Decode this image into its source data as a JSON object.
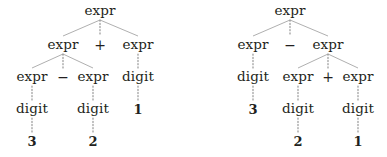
{
  "figure": {
    "background_color": "#ffffff",
    "text_color": "#231f20",
    "edge_color": "#8c8c8c",
    "width": 387,
    "height": 157
  },
  "trees": [
    {
      "id": "left-tree",
      "name": "left-parse-tree",
      "expression": "3 - 2 + 1",
      "grouping": "(3 - 2) + 1",
      "nodes": [
        {
          "id": "L0",
          "label": "expr",
          "kind": "nonterminal",
          "x": 100,
          "y": 11,
          "row": 0
        },
        {
          "id": "L1",
          "label": "expr",
          "kind": "nonterminal",
          "x": 63,
          "y": 45,
          "row": 1
        },
        {
          "id": "L2",
          "label": "+",
          "kind": "operator",
          "x": 100,
          "y": 45,
          "row": 1
        },
        {
          "id": "L3",
          "label": "expr",
          "kind": "nonterminal",
          "x": 138,
          "y": 45,
          "row": 1
        },
        {
          "id": "L4",
          "label": "expr",
          "kind": "nonterminal",
          "x": 32,
          "y": 77,
          "row": 2
        },
        {
          "id": "L5",
          "label": "−",
          "kind": "operator",
          "x": 63,
          "y": 77,
          "row": 2
        },
        {
          "id": "L6",
          "label": "expr",
          "kind": "nonterminal",
          "x": 93,
          "y": 77,
          "row": 2
        },
        {
          "id": "L7",
          "label": "digit",
          "kind": "nonterminal",
          "x": 138,
          "y": 77,
          "row": 2
        },
        {
          "id": "L8",
          "label": "digit",
          "kind": "nonterminal",
          "x": 32,
          "y": 109,
          "row": 3
        },
        {
          "id": "L9",
          "label": "digit",
          "kind": "nonterminal",
          "x": 93,
          "y": 109,
          "row": 3
        },
        {
          "id": "L10",
          "label": "1",
          "kind": "terminal",
          "x": 138,
          "y": 109,
          "row": 3
        },
        {
          "id": "L11",
          "label": "3",
          "kind": "terminal",
          "x": 32,
          "y": 141,
          "row": 4
        },
        {
          "id": "L12",
          "label": "2",
          "kind": "terminal",
          "x": 93,
          "y": 141,
          "row": 4
        }
      ],
      "edges": [
        {
          "from": "L0",
          "to": "L1",
          "style": "solid"
        },
        {
          "from": "L0",
          "to": "L2",
          "style": "dotted"
        },
        {
          "from": "L0",
          "to": "L3",
          "style": "solid"
        },
        {
          "from": "L1",
          "to": "L4",
          "style": "solid"
        },
        {
          "from": "L1",
          "to": "L5",
          "style": "dotted"
        },
        {
          "from": "L1",
          "to": "L6",
          "style": "solid"
        },
        {
          "from": "L3",
          "to": "L7",
          "style": "dotted"
        },
        {
          "from": "L4",
          "to": "L8",
          "style": "dotted"
        },
        {
          "from": "L6",
          "to": "L9",
          "style": "dotted"
        },
        {
          "from": "L7",
          "to": "L10",
          "style": "dotted"
        },
        {
          "from": "L8",
          "to": "L11",
          "style": "dotted"
        },
        {
          "from": "L9",
          "to": "L12",
          "style": "dotted"
        }
      ]
    },
    {
      "id": "right-tree",
      "name": "right-parse-tree",
      "expression": "3 - 2 + 1",
      "grouping": "3 - (2 + 1)",
      "nodes": [
        {
          "id": "R0",
          "label": "expr",
          "kind": "nonterminal",
          "x": 290,
          "y": 11,
          "row": 0
        },
        {
          "id": "R1",
          "label": "expr",
          "kind": "nonterminal",
          "x": 253,
          "y": 45,
          "row": 1
        },
        {
          "id": "R2",
          "label": "−",
          "kind": "operator",
          "x": 290,
          "y": 45,
          "row": 1
        },
        {
          "id": "R3",
          "label": "expr",
          "kind": "nonterminal",
          "x": 328,
          "y": 45,
          "row": 1
        },
        {
          "id": "R4",
          "label": "digit",
          "kind": "nonterminal",
          "x": 253,
          "y": 77,
          "row": 2
        },
        {
          "id": "R5",
          "label": "expr",
          "kind": "nonterminal",
          "x": 298,
          "y": 77,
          "row": 2
        },
        {
          "id": "R6",
          "label": "+",
          "kind": "operator",
          "x": 328,
          "y": 77,
          "row": 2
        },
        {
          "id": "R7",
          "label": "expr",
          "kind": "nonterminal",
          "x": 358,
          "y": 77,
          "row": 2
        },
        {
          "id": "R8",
          "label": "3",
          "kind": "terminal",
          "x": 253,
          "y": 109,
          "row": 3
        },
        {
          "id": "R9",
          "label": "digit",
          "kind": "nonterminal",
          "x": 298,
          "y": 109,
          "row": 3
        },
        {
          "id": "R10",
          "label": "digit",
          "kind": "nonterminal",
          "x": 358,
          "y": 109,
          "row": 3
        },
        {
          "id": "R11",
          "label": "2",
          "kind": "terminal",
          "x": 298,
          "y": 141,
          "row": 4
        },
        {
          "id": "R12",
          "label": "1",
          "kind": "terminal",
          "x": 358,
          "y": 141,
          "row": 4
        }
      ],
      "edges": [
        {
          "from": "R0",
          "to": "R1",
          "style": "solid"
        },
        {
          "from": "R0",
          "to": "R2",
          "style": "dotted"
        },
        {
          "from": "R0",
          "to": "R3",
          "style": "solid"
        },
        {
          "from": "R1",
          "to": "R4",
          "style": "dotted"
        },
        {
          "from": "R3",
          "to": "R5",
          "style": "solid"
        },
        {
          "from": "R3",
          "to": "R6",
          "style": "dotted"
        },
        {
          "from": "R3",
          "to": "R7",
          "style": "solid"
        },
        {
          "from": "R4",
          "to": "R8",
          "style": "dotted"
        },
        {
          "from": "R5",
          "to": "R9",
          "style": "dotted"
        },
        {
          "from": "R7",
          "to": "R10",
          "style": "dotted"
        },
        {
          "from": "R9",
          "to": "R11",
          "style": "dotted"
        },
        {
          "from": "R10",
          "to": "R12",
          "style": "dotted"
        }
      ]
    }
  ]
}
